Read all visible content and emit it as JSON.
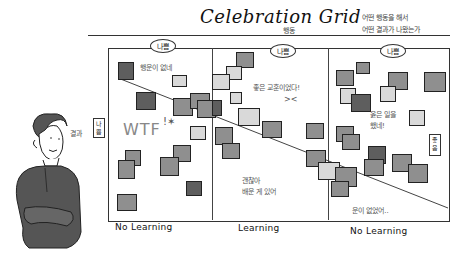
{
  "title": "Celebration Grid",
  "x_axis_caption": "행동",
  "right_caption": [
    "어떤 행동을 해서",
    "어떤 결과가 나왔는가"
  ],
  "y_axis_caption": "결과",
  "columns": [
    {
      "badge": "나쁨",
      "axis_label": "No Learning"
    },
    {
      "badge": "나쁨",
      "axis_label": "Learning"
    },
    {
      "badge": "나쁨",
      "axis_label": "No Learning"
    }
  ],
  "left_tag": "나쁨",
  "right_tag": "좋음",
  "annotations": {
    "col1_top": "행운이 없네",
    "col1_mid": "WTF",
    "col2_top": "좋은 교훈이었다!",
    "col2_bottom": [
      "괜찮아",
      "배운 게 있어"
    ],
    "col3_mid": [
      "옳은 일을",
      "했네!"
    ],
    "col3_bottom": "운이 없었어.."
  },
  "colors": {
    "note_dark": "#5e5e5e",
    "note_mid": "#8f8f8f",
    "note_light": "#d9d9d9",
    "line": "#333333"
  }
}
